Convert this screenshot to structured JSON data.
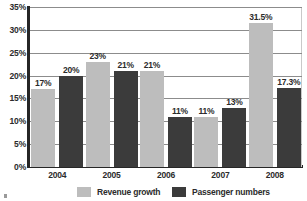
{
  "chart_data": {
    "type": "bar",
    "title": "",
    "xlabel": "",
    "ylabel": "",
    "categories": [
      "2004",
      "2005",
      "2006",
      "2007",
      "2008"
    ],
    "series": [
      {
        "name": "Revenue growth",
        "color": "#bdbdbd",
        "values": [
          17,
          23,
          21,
          11,
          31.5
        ],
        "labels": [
          "17%",
          "23%",
          "21%",
          "11%",
          "31.5%"
        ]
      },
      {
        "name": "Passenger numbers",
        "color": "#3b3b3b",
        "values": [
          20,
          21,
          11,
          13,
          17.3
        ],
        "labels": [
          "20%",
          "21%",
          "11%",
          "13%",
          "17.3%"
        ]
      }
    ],
    "ylim": [
      0,
      35
    ],
    "yticks": [
      0,
      5,
      10,
      15,
      20,
      25,
      30,
      35
    ],
    "ytick_labels": [
      "0%",
      "5%",
      "10%",
      "15%",
      "20%",
      "25%",
      "30%",
      "35%"
    ],
    "grid": true,
    "legend_position": "bottom"
  }
}
